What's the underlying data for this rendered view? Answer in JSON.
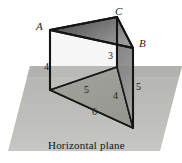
{
  "figure": {
    "plane_caption": "Horizontal plane",
    "vertices": [
      {
        "name": "A",
        "label": "A",
        "x": 38,
        "y": 24
      },
      {
        "name": "C",
        "label": "C",
        "x": 117,
        "y": 10
      },
      {
        "name": "B",
        "label": "B",
        "x": 140,
        "y": 41
      }
    ],
    "edge_labels": [
      {
        "name": "edge-CD-length",
        "label": "3",
        "x": 109,
        "y": 53
      },
      {
        "name": "edge-AE-length",
        "label": "4",
        "x": 46,
        "y": 64
      },
      {
        "name": "edge-BF-length",
        "label": "5",
        "x": 137,
        "y": 83
      },
      {
        "name": "edge-EG-length",
        "label": "5",
        "x": 85,
        "y": 87
      },
      {
        "name": "edge-GF-length",
        "label": "4",
        "x": 114,
        "y": 92
      },
      {
        "name": "edge-EF-length",
        "label": "6",
        "x": 93,
        "y": 108
      }
    ],
    "colors": {
      "plane_fill": "#b9b9b5",
      "plane_fill_light": "#c3c3bf",
      "triangle_base_fill": "#9a9a96",
      "top_face_dark": "#4a4a4a",
      "top_face_light": "#8e8e8e",
      "side_face_fill": "#7d7d7d",
      "stroke": "#1a1a1a",
      "background": "#ffffff",
      "label_text": "#1b1b1b"
    },
    "geometry": {
      "plane_polygon": "30,66 182,66 160,151 8,151",
      "top_triangle": "50,30 117,17 133,48",
      "vertical_A": "50,30 50,90",
      "vertical_C": "117,17 117,48",
      "vertical_B": "133,48 133,128",
      "base_triangle": "50,90 117,67 133,128",
      "mid_rect": "50,30 50,90 133,128 133,48"
    }
  }
}
